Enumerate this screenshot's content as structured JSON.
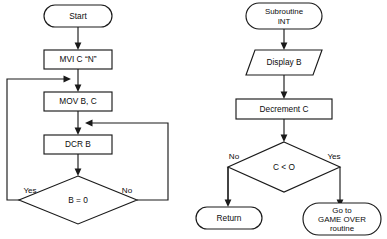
{
  "diagram": {
    "background_color": "#ffffff",
    "line_color": "#1a1a1a",
    "text_color": "#0d0d0d"
  },
  "main_flow": {
    "start": {
      "label": "Start",
      "shape": "terminal"
    },
    "init_counter": {
      "label": "MVI C “N”",
      "shape": "process"
    },
    "load_b": {
      "label": "MOV B, C",
      "shape": "process"
    },
    "decrement_b": {
      "label": "DCR B",
      "shape": "process"
    },
    "test_b": {
      "label": "B = 0",
      "shape": "decision",
      "yes_label": "Yes",
      "no_label": "No"
    }
  },
  "subroutine_flow": {
    "entry": {
      "line1": "Subroutine",
      "line2": "INT",
      "shape": "terminal"
    },
    "display": {
      "label": "Display B",
      "shape": "input-output"
    },
    "decrement_c": {
      "label": "Decrement C",
      "shape": "process"
    },
    "test_c": {
      "label": "C < O",
      "shape": "decision",
      "no_label": "No",
      "yes_label": "Yes"
    },
    "return": {
      "label": "Return",
      "shape": "terminal"
    },
    "game_over": {
      "line1": "Go to",
      "line2": "GAME OVER",
      "line3": "routine",
      "shape": "terminal"
    }
  }
}
